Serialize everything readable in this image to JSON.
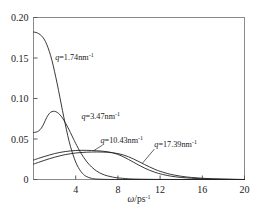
{
  "chart_data": {
    "type": "line",
    "title": "",
    "subtitle": "",
    "xlabel": "ω/ps⁻¹",
    "ylabel": "",
    "xlim": [
      0,
      20
    ],
    "ylim": [
      0,
      0.2
    ],
    "xticks": [
      4,
      8,
      12,
      16,
      20
    ],
    "xtick_labels": [
      "4",
      "8",
      "12",
      "16",
      "20"
    ],
    "yticks": [
      0,
      0.05,
      0.1,
      0.15,
      0.2
    ],
    "ytick_labels": [
      "0",
      "0.05",
      "0.10",
      "0.15",
      "0.20"
    ],
    "grid": false,
    "legend_position": "inline-annotations",
    "line_color": "#222222",
    "frame_color": "#8a8a8a",
    "series": [
      {
        "name": "q=1.74nm⁻¹",
        "label_text": "q=1.74nm",
        "label_sup": "-1",
        "label_x": 2.05,
        "label_y": 0.148,
        "x": [
          0.0,
          0.25,
          0.5,
          0.75,
          1.0,
          1.25,
          1.5,
          1.75,
          2.0,
          2.25,
          2.5,
          2.75,
          3.0,
          3.25,
          3.5,
          3.75,
          4.0,
          4.25,
          4.5,
          4.75,
          5.0,
          5.5,
          6.0,
          7.0,
          8.0,
          10.0,
          12.0,
          16.0,
          20.0
        ],
        "y": [
          0.182,
          0.1815,
          0.18,
          0.1775,
          0.1735,
          0.167,
          0.158,
          0.147,
          0.133,
          0.118,
          0.1015,
          0.085,
          0.069,
          0.054,
          0.041,
          0.0305,
          0.0215,
          0.0148,
          0.0098,
          0.0062,
          0.0038,
          0.0014,
          0.0005,
          0.0001,
          0.0,
          0.0,
          0.0,
          0.0,
          0.0
        ]
      },
      {
        "name": "q=3.47nm⁻¹",
        "label_text": "q=3.47nm",
        "label_sup": "-1",
        "label_x": 4.55,
        "label_y": 0.0745,
        "x": [
          0.0,
          0.25,
          0.5,
          0.75,
          1.0,
          1.25,
          1.5,
          1.75,
          2.0,
          2.25,
          2.5,
          2.75,
          3.0,
          3.25,
          3.5,
          3.75,
          4.0,
          4.5,
          5.0,
          5.5,
          6.0,
          6.5,
          7.0,
          7.5,
          8.0,
          9.0,
          10.0,
          12.0,
          14.0,
          16.0,
          20.0
        ],
        "y": [
          0.058,
          0.0585,
          0.06,
          0.0635,
          0.0695,
          0.0765,
          0.0815,
          0.0838,
          0.0842,
          0.0828,
          0.08,
          0.0758,
          0.0705,
          0.0645,
          0.058,
          0.0512,
          0.0445,
          0.0325,
          0.0228,
          0.0155,
          0.0103,
          0.0068,
          0.0045,
          0.003,
          0.002,
          0.0009,
          0.0004,
          0.0001,
          0.0,
          0.0,
          0.0
        ]
      },
      {
        "name": "q=10.43nm⁻¹",
        "label_text": "q=10.43nm",
        "label_sup": "-1",
        "label_x": 6.35,
        "label_y": 0.0455,
        "x": [
          0.0,
          0.5,
          1.0,
          1.5,
          2.0,
          2.5,
          3.0,
          3.5,
          4.0,
          4.5,
          5.0,
          5.5,
          6.0,
          6.5,
          7.0,
          7.5,
          8.0,
          8.5,
          9.0,
          9.5,
          10.0,
          10.5,
          11.0,
          11.5,
          12.0,
          13.0,
          14.0,
          15.0,
          16.0,
          17.0,
          18.0,
          19.0,
          20.0
        ],
        "y": [
          0.024,
          0.0262,
          0.0283,
          0.0302,
          0.032,
          0.0334,
          0.0345,
          0.0353,
          0.0358,
          0.036,
          0.036,
          0.0358,
          0.0355,
          0.035,
          0.0343,
          0.033,
          0.031,
          0.0282,
          0.0248,
          0.0212,
          0.0176,
          0.0143,
          0.0114,
          0.009,
          0.007,
          0.0042,
          0.0025,
          0.0015,
          0.0009,
          0.0005,
          0.0003,
          0.0001,
          0.0
        ]
      },
      {
        "name": "q=17.39nm⁻¹",
        "label_text": "q=17.39nm",
        "label_sup": "-1",
        "label_x": 11.45,
        "label_y": 0.0405,
        "x": [
          0.0,
          0.5,
          1.0,
          1.5,
          2.0,
          2.5,
          3.0,
          3.5,
          4.0,
          4.5,
          5.0,
          5.5,
          6.0,
          6.5,
          7.0,
          7.5,
          8.0,
          8.5,
          9.0,
          9.5,
          10.0,
          10.5,
          11.0,
          11.5,
          12.0,
          13.0,
          14.0,
          15.0,
          16.0,
          17.0,
          18.0,
          19.0,
          20.0
        ],
        "y": [
          0.019,
          0.0213,
          0.0235,
          0.0256,
          0.0275,
          0.0292,
          0.0307,
          0.0318,
          0.0327,
          0.0333,
          0.0337,
          0.0339,
          0.034,
          0.0339,
          0.0336,
          0.033,
          0.032,
          0.0304,
          0.0281,
          0.0252,
          0.022,
          0.0187,
          0.0155,
          0.0126,
          0.0101,
          0.0064,
          0.004,
          0.0025,
          0.0015,
          0.0009,
          0.0005,
          0.0002,
          0.0
        ]
      }
    ],
    "leader_lines": [
      {
        "name": "leader-10-43",
        "x1": 6.55,
        "y1": 0.0425,
        "x2": 5.75,
        "y2": 0.036
      },
      {
        "name": "leader-17-39",
        "x1": 11.45,
        "y1": 0.0375,
        "x2": 10.35,
        "y2": 0.0205
      }
    ]
  }
}
